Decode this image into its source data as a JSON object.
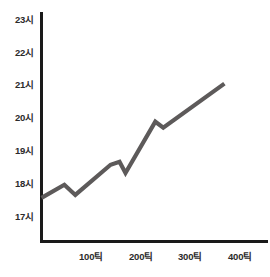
{
  "chart_data": {
    "type": "line",
    "title": "",
    "xlabel": "",
    "ylabel": "",
    "xlim": [
      0,
      420
    ],
    "ylim": [
      16.55,
      23.0
    ],
    "grid": false,
    "legend": null,
    "line_color": "#5d5a5a",
    "axis_color": "#1a1a1a",
    "x_ticks": [
      {
        "value": 100,
        "label": "100틱"
      },
      {
        "value": 200,
        "label": "200틱"
      },
      {
        "value": 300,
        "label": "300틱"
      },
      {
        "value": 400,
        "label": "400틱"
      }
    ],
    "y_ticks": [
      {
        "value": 23,
        "label": "23시"
      },
      {
        "value": 22,
        "label": "22시"
      },
      {
        "value": 21,
        "label": "21시"
      },
      {
        "value": 20,
        "label": "20시"
      },
      {
        "value": 19,
        "label": "19시"
      },
      {
        "value": 18,
        "label": "18시"
      },
      {
        "value": 17,
        "label": "17시"
      }
    ],
    "series": [
      {
        "name": "",
        "x": [
          0,
          46,
          68,
          139,
          157,
          169,
          229,
          245,
          368
        ],
        "y": [
          17.52,
          17.92,
          17.61,
          18.53,
          18.62,
          18.28,
          19.84,
          19.66,
          21.0
        ]
      }
    ]
  },
  "axis": {
    "y_axis_name": "y-axis-line",
    "x_axis_name": "x-axis-line"
  }
}
